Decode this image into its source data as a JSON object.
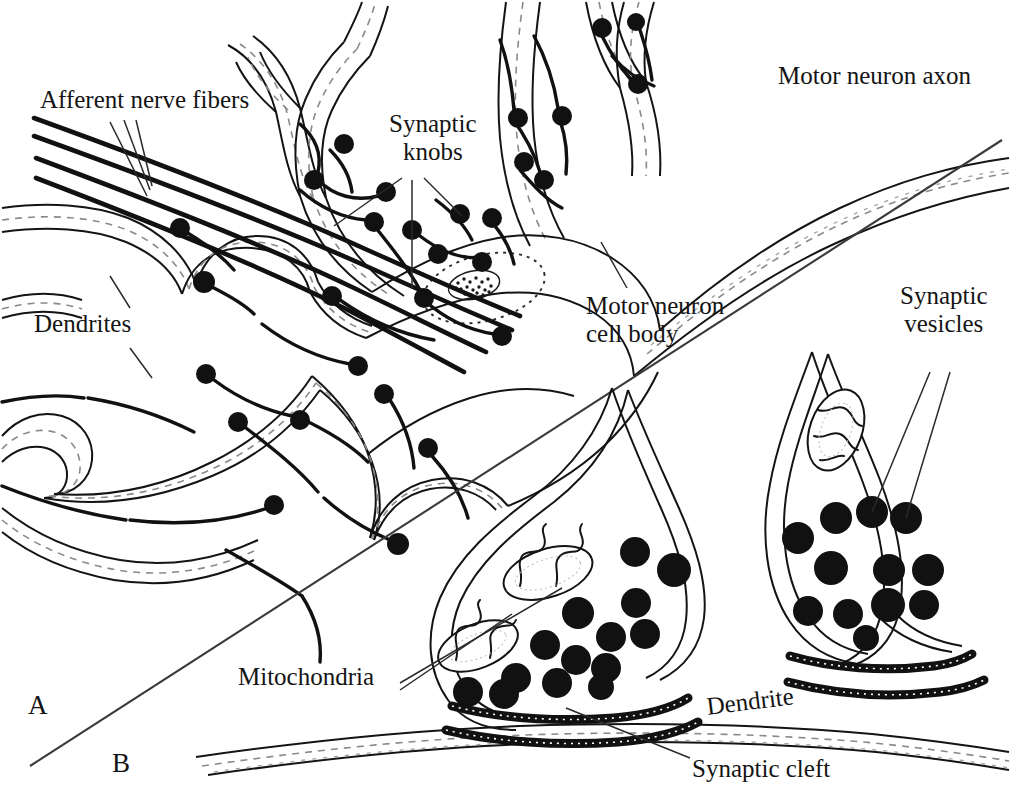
{
  "figure": {
    "type": "anatomical-line-drawing",
    "background_color": "#ffffff",
    "ink_color": "#141414",
    "panels": [
      {
        "id": "A",
        "letter": "A",
        "description": "Motor neuron cell body with dendrites, afferent nerve fibers and synaptic knobs"
      },
      {
        "id": "B",
        "letter": "B",
        "description": "Enlarged detail of two synaptic knobs on a dendrite showing vesicles, mitochondria and synaptic cleft"
      }
    ]
  },
  "labels": {
    "afferent_nerve_fibers": "Afferent nerve fibers",
    "synaptic_knobs": "Synaptic\nknobs",
    "motor_neuron_axon": "Motor neuron axon",
    "motor_neuron_cell_body": "Motor neuron\ncell body",
    "dendrites": "Dendrites",
    "synaptic_vesicles": "Synaptic\nvesicles",
    "mitochondria": "Mitochondria",
    "dendrite": "Dendrite",
    "synaptic_cleft": "Synaptic cleft",
    "panel_a": "A",
    "panel_b": "B"
  },
  "structures": {
    "panel_b_left_knob": {
      "vesicle_count": 14,
      "mitochondria_count": 2
    },
    "panel_b_right_knob": {
      "vesicle_count": 12,
      "mitochondria_count": 1
    },
    "panel_a": {
      "afferent_fiber_lines": 4,
      "leader_lines_to_fibers": 3,
      "nucleus": "dotted ellipse with stippled nucleolus"
    }
  }
}
